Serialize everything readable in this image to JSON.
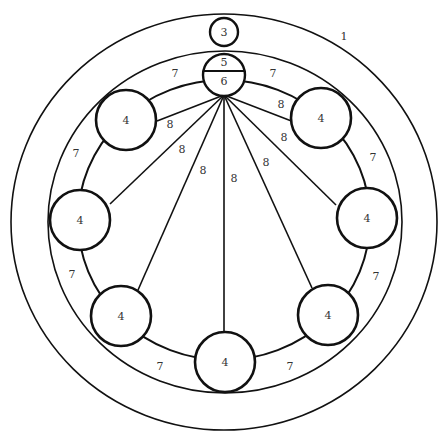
{
  "diagram": {
    "colors": {
      "stroke": "#111111",
      "text": "#333333",
      "background": "#ffffff"
    },
    "outer_ring": {
      "label": "1",
      "cx": 224,
      "cy": 222,
      "rx": 213,
      "ry": 208
    },
    "inner_ring": {
      "cx": 225,
      "cy": 222,
      "rx": 177,
      "ry": 171
    },
    "path_ring": {
      "cx": 224,
      "cy": 220,
      "rx": 146,
      "ry": 140
    },
    "top_node": {
      "label": "3",
      "cx": 224,
      "cy": 32,
      "r": 14
    },
    "hub": {
      "top_label": "5",
      "bottom_label": "6",
      "cx": 224,
      "cy": 75,
      "r": 21
    },
    "convergence_point": {
      "x": 224,
      "y": 95
    },
    "nodes": [
      {
        "label": "4",
        "cx": 126,
        "cy": 120,
        "r": 30
      },
      {
        "label": "4",
        "cx": 321,
        "cy": 118,
        "r": 30
      },
      {
        "label": "4",
        "cx": 80,
        "cy": 220,
        "r": 30
      },
      {
        "label": "4",
        "cx": 367,
        "cy": 218,
        "r": 30
      },
      {
        "label": "4",
        "cx": 121,
        "cy": 316,
        "r": 30
      },
      {
        "label": "4",
        "cx": 328,
        "cy": 315,
        "r": 30
      },
      {
        "label": "4",
        "cx": 225,
        "cy": 362,
        "r": 30
      }
    ],
    "spokes": [
      {
        "label": "8",
        "x2": 157,
        "y2": 121,
        "lx": 170,
        "ly": 128
      },
      {
        "label": "8",
        "x2": 294,
        "y2": 122,
        "lx": 281,
        "ly": 108
      },
      {
        "label": "8",
        "x2": 110,
        "y2": 204,
        "lx": 182,
        "ly": 153
      },
      {
        "label": "8",
        "x2": 336,
        "y2": 205,
        "lx": 284,
        "ly": 141
      },
      {
        "label": "8",
        "x2": 138,
        "y2": 290,
        "lx": 203,
        "ly": 174
      },
      {
        "label": "8",
        "x2": 312,
        "y2": 288,
        "lx": 266,
        "ly": 166
      },
      {
        "label": "8",
        "x2": 224,
        "y2": 331,
        "lx": 234,
        "ly": 182
      }
    ],
    "arc_labels": [
      {
        "label": "7",
        "x": 175,
        "y": 77
      },
      {
        "label": "7",
        "x": 273,
        "y": 77
      },
      {
        "label": "7",
        "x": 76,
        "y": 157
      },
      {
        "label": "7",
        "x": 373,
        "y": 161
      },
      {
        "label": "7",
        "x": 72,
        "y": 278
      },
      {
        "label": "7",
        "x": 376,
        "y": 280
      },
      {
        "label": "7",
        "x": 160,
        "y": 370
      },
      {
        "label": "7",
        "x": 290,
        "y": 370
      }
    ],
    "outer_label_pos": {
      "x": 344,
      "y": 40
    }
  }
}
